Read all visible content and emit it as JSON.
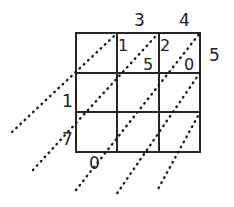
{
  "figure": {
    "kind": "lattice-multiplication-grid",
    "rows": 3,
    "cols": 3,
    "grid": {
      "x": 76,
      "y": 33,
      "width": 124,
      "height": 119
    },
    "stroke_color": "#262626",
    "diagonal_color": "#1a1a1a",
    "background": "#ffffff"
  },
  "column_headers": [
    {
      "text": "",
      "x": 93,
      "y": 12
    },
    {
      "text": "3",
      "x": 134,
      "y": 12
    },
    {
      "text": "4",
      "x": 179,
      "y": 12
    }
  ],
  "right_labels": [
    {
      "text": "5",
      "x": 209,
      "y": 47
    }
  ],
  "left_labels": [
    {
      "text": "1",
      "x": 62,
      "y": 93
    },
    {
      "text": "7",
      "x": 62,
      "y": 131
    }
  ],
  "bottom_labels": [
    {
      "text": "0",
      "x": 89,
      "y": 155
    }
  ],
  "cells": [
    {
      "row": 1,
      "col": 1,
      "upper": "",
      "lower": ""
    },
    {
      "row": 1,
      "col": 2,
      "upper": "1",
      "lower": "5"
    },
    {
      "row": 1,
      "col": 3,
      "upper": "2",
      "lower": "0"
    },
    {
      "row": 2,
      "col": 1,
      "upper": "",
      "lower": ""
    },
    {
      "row": 2,
      "col": 2,
      "upper": "",
      "lower": ""
    },
    {
      "row": 2,
      "col": 3,
      "upper": "",
      "lower": ""
    },
    {
      "row": 3,
      "col": 1,
      "upper": "",
      "lower": ""
    },
    {
      "row": 3,
      "col": 2,
      "upper": "",
      "lower": ""
    },
    {
      "row": 3,
      "col": 3,
      "upper": "",
      "lower": ""
    }
  ],
  "cell_digits": [
    {
      "text": "1",
      "x": 118,
      "y": 38
    },
    {
      "text": "5",
      "x": 143,
      "y": 57
    },
    {
      "text": "2",
      "x": 160,
      "y": 38
    },
    {
      "text": "0",
      "x": 184,
      "y": 57
    }
  ]
}
